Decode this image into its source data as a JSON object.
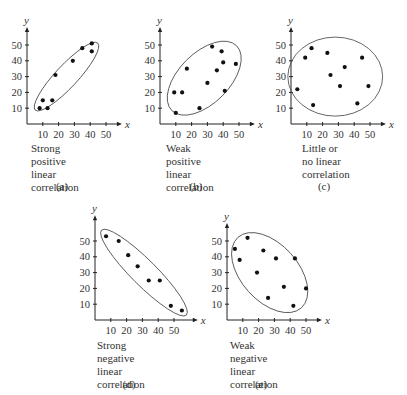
{
  "colors": {
    "ink": "#222222",
    "ellipse": "#555555",
    "text": "#333333",
    "background": "#ffffff"
  },
  "axes": {
    "x_label": "x",
    "y_label": "y",
    "x_ticks": [
      "10",
      "20",
      "30",
      "40",
      "50"
    ],
    "y_ticks": [
      "10",
      "20",
      "30",
      "40",
      "50"
    ]
  },
  "chart_data": [
    {
      "id": "a",
      "type": "scatter",
      "panel_label": "(a)",
      "title": "Strong positive linear correlation",
      "caption_lines": [
        "Strong positive linear",
        "correlation"
      ],
      "xlabel": "x",
      "ylabel": "y",
      "xlim": [
        0,
        55
      ],
      "ylim": [
        0,
        55
      ],
      "x_ticks": [
        10,
        20,
        30,
        40,
        50
      ],
      "y_ticks": [
        10,
        20,
        30,
        40,
        50
      ],
      "grid": false,
      "points": [
        [
          8,
          10
        ],
        [
          10,
          15
        ],
        [
          13,
          10
        ],
        [
          16,
          15
        ],
        [
          18,
          31
        ],
        [
          29,
          40
        ],
        [
          35,
          48
        ],
        [
          41,
          46
        ],
        [
          41,
          51
        ]
      ],
      "ellipse": {
        "cx": 25,
        "cy": 30,
        "rx": 29,
        "ry": 7,
        "angle_deg": 47
      }
    },
    {
      "id": "b",
      "type": "scatter",
      "panel_label": "(b)",
      "title": "Weak positive linear correlation",
      "caption_lines": [
        "Weak positive linear",
        "correlation"
      ],
      "xlabel": "x",
      "ylabel": "y",
      "xlim": [
        0,
        55
      ],
      "ylim": [
        0,
        55
      ],
      "x_ticks": [
        10,
        20,
        30,
        40,
        50
      ],
      "y_ticks": [
        10,
        20,
        30,
        40,
        50
      ],
      "grid": false,
      "points": [
        [
          9,
          20
        ],
        [
          10,
          7
        ],
        [
          14,
          20
        ],
        [
          17,
          35
        ],
        [
          25,
          10
        ],
        [
          30,
          26
        ],
        [
          33,
          49
        ],
        [
          36,
          34
        ],
        [
          39,
          46
        ],
        [
          40,
          39
        ],
        [
          41,
          21
        ],
        [
          48,
          38
        ]
      ],
      "ellipse": {
        "cx": 28,
        "cy": 29,
        "rx": 29,
        "ry": 16,
        "angle_deg": 45
      }
    },
    {
      "id": "c",
      "type": "scatter",
      "panel_label": "(c)",
      "title": "Little or no linear correlation",
      "caption_lines": [
        "Little or no linear",
        "correlation"
      ],
      "xlabel": "x",
      "ylabel": "y",
      "xlim": [
        0,
        55
      ],
      "ylim": [
        0,
        55
      ],
      "x_ticks": [
        10,
        20,
        30,
        40,
        50
      ],
      "y_ticks": [
        10,
        20,
        30,
        40,
        50
      ],
      "grid": false,
      "points": [
        [
          4,
          22
        ],
        [
          9,
          42
        ],
        [
          13,
          48
        ],
        [
          14,
          12
        ],
        [
          23,
          45
        ],
        [
          25,
          31
        ],
        [
          31,
          24
        ],
        [
          34,
          36
        ],
        [
          42,
          13
        ],
        [
          45,
          42
        ],
        [
          49,
          24
        ]
      ],
      "ellipse": {
        "cx": 28,
        "cy": 30,
        "rx": 30,
        "ry": 25,
        "angle_deg": 0
      }
    },
    {
      "id": "d",
      "type": "scatter",
      "panel_label": "(d)",
      "title": "Strong negative linear correlation",
      "caption_lines": [
        "Strong negative linear",
        "correlation"
      ],
      "xlabel": "x",
      "ylabel": "y",
      "xlim": [
        0,
        60
      ],
      "ylim": [
        0,
        60
      ],
      "x_ticks": [
        10,
        20,
        30,
        40,
        50
      ],
      "y_ticks": [
        10,
        20,
        30,
        40,
        50
      ],
      "grid": false,
      "points": [
        [
          7,
          53
        ],
        [
          15,
          50
        ],
        [
          21,
          41
        ],
        [
          27,
          34
        ],
        [
          34,
          25
        ],
        [
          41,
          25
        ],
        [
          48,
          9
        ],
        [
          55,
          6
        ]
      ],
      "ellipse": {
        "cx": 31,
        "cy": 30,
        "rx": 38,
        "ry": 8,
        "angle_deg": -45
      }
    },
    {
      "id": "e",
      "type": "scatter",
      "panel_label": "(e)",
      "title": "Weak negative linear correlation",
      "caption_lines": [
        "Weak negative linear",
        "correlation"
      ],
      "xlabel": "x",
      "ylabel": "y",
      "xlim": [
        0,
        55
      ],
      "ylim": [
        0,
        55
      ],
      "x_ticks": [
        10,
        20,
        30,
        40,
        50
      ],
      "y_ticks": [
        10,
        20,
        30,
        40,
        50
      ],
      "grid": false,
      "points": [
        [
          5,
          45
        ],
        [
          8,
          38
        ],
        [
          13,
          52
        ],
        [
          19,
          30
        ],
        [
          23,
          44
        ],
        [
          26,
          14
        ],
        [
          31,
          39
        ],
        [
          36,
          21
        ],
        [
          42,
          9
        ],
        [
          43,
          39
        ],
        [
          50,
          20
        ]
      ],
      "ellipse": {
        "cx": 27,
        "cy": 30,
        "rx": 30,
        "ry": 18,
        "angle_deg": -48
      }
    }
  ],
  "layout": {
    "panels": [
      {
        "id": "a",
        "origin_x": 27,
        "origin_y": 124,
        "caption_x": 31,
        "caption_y": 142,
        "label_x": 62,
        "label_y": 180
      },
      {
        "id": "b",
        "origin_x": 160,
        "origin_y": 124,
        "caption_x": 166,
        "caption_y": 142,
        "label_x": 196,
        "label_y": 180
      },
      {
        "id": "c",
        "origin_x": 291,
        "origin_y": 124,
        "caption_x": 302,
        "caption_y": 142,
        "label_x": 324,
        "label_y": 180
      },
      {
        "id": "d",
        "origin_x": 95,
        "origin_y": 320,
        "caption_x": 97,
        "caption_y": 339,
        "label_x": 129,
        "label_y": 378
      },
      {
        "id": "e",
        "origin_x": 227,
        "origin_y": 320,
        "caption_x": 230,
        "caption_y": 339,
        "label_x": 261,
        "label_y": 378
      }
    ],
    "px_per_unit": 1.58
  }
}
